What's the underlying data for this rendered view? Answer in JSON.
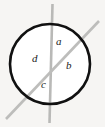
{
  "figure": {
    "background_color": "#f6f5f3",
    "circle": {
      "name": "circle",
      "cx": 50,
      "cy": 64,
      "r": 40,
      "stroke_color": "#111111",
      "stroke_width": 2.6,
      "fill_color": "#ffffff"
    },
    "lines": [
      {
        "name": "vertical-line",
        "x1": 52.5,
        "y1": 4,
        "x2": 49.5,
        "y2": 123,
        "stroke_color": "#b9b9b7",
        "stroke_width": 2.6
      },
      {
        "name": "diagonal-line",
        "x1": 6,
        "y1": 119,
        "x2": 99,
        "y2": 21,
        "stroke_color": "#bdbdbb",
        "stroke_width": 2.6
      }
    ],
    "labels": [
      {
        "id": "a",
        "text": "a",
        "x": 56,
        "y": 36
      },
      {
        "id": "b",
        "text": "b",
        "x": 66,
        "y": 60
      },
      {
        "id": "c",
        "text": "c",
        "x": 41,
        "y": 79
      },
      {
        "id": "d",
        "text": "d",
        "x": 32,
        "y": 53
      }
    ]
  }
}
